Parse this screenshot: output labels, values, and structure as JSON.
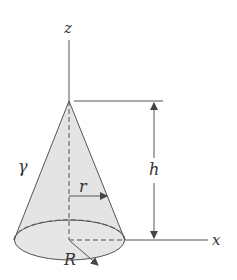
{
  "diagram": {
    "labels": {
      "z_axis": "z",
      "x_axis": "x",
      "height": "h",
      "slant_surface": "γ",
      "cross_section_radius": "r",
      "base_radius": "R"
    },
    "colors": {
      "line": "#555555",
      "cone_fill": "#e4e4e4",
      "base_fill": "#e8e8e8"
    }
  }
}
